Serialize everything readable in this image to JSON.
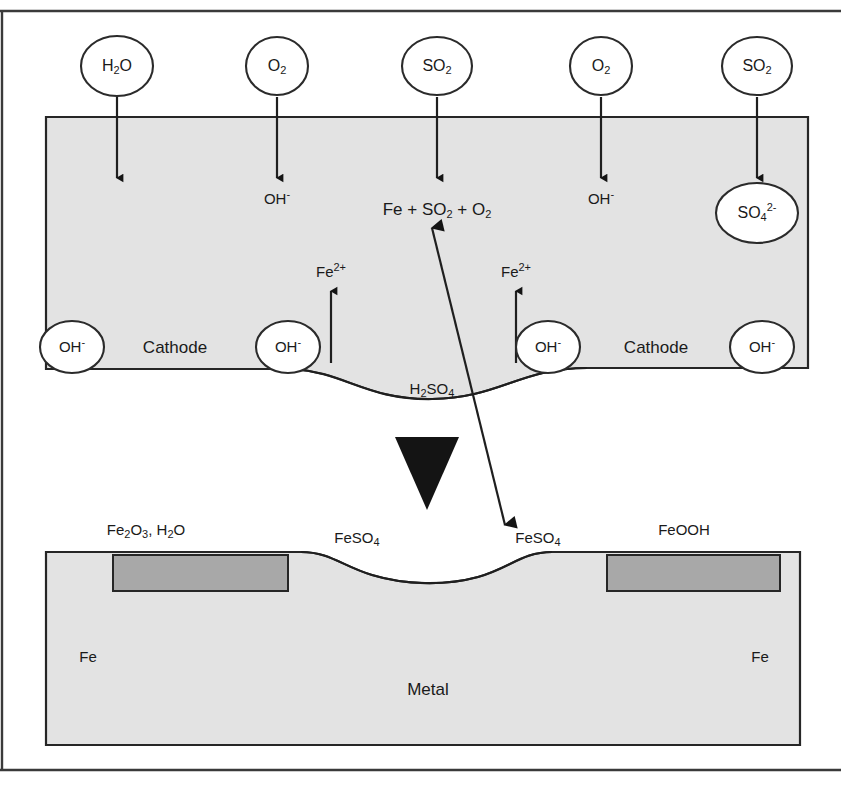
{
  "figure": {
    "colors": {
      "region_fill": "#e3e3e3",
      "oxide_fill": "#a8a8a8",
      "bubble_fill": "#ffffff",
      "stroke": "#262626",
      "text": "#1a1a1a"
    }
  },
  "top_gas_bubbles": [
    {
      "id": "bubble-h2o",
      "formula": "H2O",
      "base": "H",
      "sub": "2",
      "tail": "O",
      "sup": "",
      "x": 117,
      "y": 66
    },
    {
      "id": "bubble-o2-1",
      "formula": "O2",
      "base": "O",
      "sub": "2",
      "tail": "",
      "sup": "",
      "x": 277,
      "y": 66
    },
    {
      "id": "bubble-so2-1",
      "formula": "SO2",
      "base": "SO",
      "sub": "2",
      "tail": "",
      "sup": "",
      "x": 437,
      "y": 66
    },
    {
      "id": "bubble-o2-2",
      "formula": "O2",
      "base": "O",
      "sub": "2",
      "tail": "",
      "sup": "",
      "x": 601,
      "y": 66
    },
    {
      "id": "bubble-so2-2",
      "formula": "SO2",
      "base": "SO",
      "sub": "2",
      "tail": "",
      "sup": "",
      "x": 757,
      "y": 66
    }
  ],
  "downward_arrows": [
    {
      "id": "arrow-h2o",
      "x": 117,
      "y_start": 96,
      "y_end": 180
    },
    {
      "id": "arrow-o2-1",
      "x": 277,
      "y_start": 96,
      "y_end": 180
    },
    {
      "id": "arrow-so2-1",
      "x": 437,
      "y_start": 96,
      "y_end": 180
    },
    {
      "id": "arrow-o2-2",
      "x": 601,
      "y_start": 96,
      "y_end": 180
    },
    {
      "id": "arrow-so2-2",
      "x": 757,
      "y_start": 96,
      "y_end": 180
    }
  ],
  "electrolyte_labels": [
    {
      "id": "oh-left",
      "text": "OH",
      "sup": "-",
      "x": 277,
      "y": 199
    },
    {
      "id": "oh-right",
      "text": "OH",
      "sup": "-",
      "x": 601,
      "y": 199
    }
  ],
  "reaction_label": {
    "id": "reaction-fe-so2-o2",
    "text": "Fe + SO2 + O2",
    "parts": [
      {
        "t": "Fe + SO",
        "k": "base"
      },
      {
        "t": "2",
        "k": "sub"
      },
      {
        "t": " + O",
        "k": "base"
      },
      {
        "t": "2",
        "k": "sub"
      }
    ],
    "x": 437,
    "y": 211
  },
  "sulfate_bubble": {
    "id": "bubble-so4",
    "text": "SO4 2-",
    "base": "SO",
    "sub": "4",
    "sup": "2-",
    "x": 757,
    "y": 213
  },
  "fe2plus_labels": [
    {
      "id": "fe2plus-left",
      "base": "Fe",
      "sup": "2+",
      "x": 331,
      "y": 272
    },
    {
      "id": "fe2plus-right",
      "base": "Fe",
      "sup": "2+",
      "x": 516,
      "y": 272
    }
  ],
  "fe2plus_arrows": [
    {
      "id": "arrow-fe2plus-left",
      "x": 331,
      "y_start": 363,
      "y_end": 290
    },
    {
      "id": "arrow-fe2plus-right",
      "x": 516,
      "y_start": 363,
      "y_end": 290
    }
  ],
  "cathode_row": {
    "oh_bubbles": [
      {
        "id": "oh-bubble-1",
        "base": "OH",
        "sup": "-",
        "x": 72,
        "y": 347
      },
      {
        "id": "oh-bubble-2",
        "base": "OH",
        "sup": "-",
        "x": 288,
        "y": 347
      },
      {
        "id": "oh-bubble-3",
        "base": "OH",
        "sup": "-",
        "x": 548,
        "y": 347
      },
      {
        "id": "oh-bubble-4",
        "base": "OH",
        "sup": "-",
        "x": 762,
        "y": 347
      }
    ],
    "cathode_labels": [
      {
        "id": "cathode-left",
        "text": "Cathode",
        "x": 175,
        "y": 348
      },
      {
        "id": "cathode-right",
        "text": "Cathode",
        "x": 656,
        "y": 348
      }
    ]
  },
  "acid_label": {
    "id": "h2so4-label",
    "base": "H",
    "sub1": "2",
    "mid": "SO",
    "sub2": "4",
    "text": "H2SO4",
    "x": 432,
    "y": 389
  },
  "bottom_labels": [
    {
      "id": "label-fe2o3-h2o",
      "text": "Fe2O3, H2O",
      "x": 146,
      "y": 530,
      "parts": [
        {
          "t": "Fe",
          "k": "base"
        },
        {
          "t": "2",
          "k": "sub"
        },
        {
          "t": "O",
          "k": "base"
        },
        {
          "t": "3",
          "k": "sub"
        },
        {
          "t": ", H",
          "k": "base"
        },
        {
          "t": "2",
          "k": "sub"
        },
        {
          "t": "O",
          "k": "base"
        }
      ]
    },
    {
      "id": "label-feso4-left",
      "text": "FeSO4",
      "x": 357,
      "y": 538,
      "parts": [
        {
          "t": "FeSO",
          "k": "base"
        },
        {
          "t": "4",
          "k": "sub"
        }
      ]
    },
    {
      "id": "label-feso4-right",
      "text": "FeSO4",
      "x": 538,
      "y": 538,
      "parts": [
        {
          "t": "FeSO",
          "k": "base"
        },
        {
          "t": "4",
          "k": "sub"
        }
      ]
    },
    {
      "id": "label-feooh",
      "text": "FeOOH",
      "x": 684,
      "y": 530,
      "parts": [
        {
          "t": "FeOOH",
          "k": "base"
        }
      ]
    }
  ],
  "metal_labels": [
    {
      "id": "fe-left",
      "text": "Fe",
      "x": 88,
      "y": 657
    },
    {
      "id": "fe-right",
      "text": "Fe",
      "x": 760,
      "y": 657
    },
    {
      "id": "metal",
      "text": "Metal",
      "x": 428,
      "y": 690
    }
  ],
  "diagonal_arrow": {
    "id": "arrow-transport",
    "from_x": 505,
    "from_y": 525,
    "to_x": 432,
    "to_y": 228,
    "double_headed": true
  },
  "marker_triangle": {
    "id": "marker-triangle-down",
    "cx": 427,
    "top_y": 437,
    "bottom_y": 508,
    "half_width": 32
  }
}
